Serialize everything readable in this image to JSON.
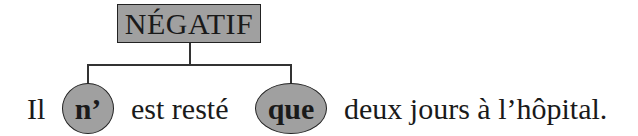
{
  "diagram": {
    "category_label": "NÉGATIF",
    "sentence": {
      "words": [
        {
          "text": "Il",
          "highlighted": false
        },
        {
          "text": "n’",
          "highlighted": true
        },
        {
          "text": "est resté",
          "highlighted": false
        },
        {
          "text": "que",
          "highlighted": true
        },
        {
          "text": "deux jours à l’hôpital.",
          "highlighted": false
        }
      ]
    },
    "links": [
      {
        "from": "NÉGATIF",
        "to": "n’"
      },
      {
        "from": "NÉGATIF",
        "to": "que"
      }
    ],
    "colors": {
      "box_fill": "#a0a0a0",
      "bubble_fill": "#a0a0a0",
      "line": "#333333",
      "text": "#1a1a1a"
    }
  }
}
